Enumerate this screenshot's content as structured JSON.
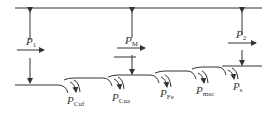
{
  "diagram": {
    "stroke_color": "#333333",
    "labels": {
      "p1": {
        "main": "P",
        "sub": "1"
      },
      "pm": {
        "main": "P",
        "sub": "M"
      },
      "p2": {
        "main": "P",
        "sub": "2"
      },
      "pcuf": {
        "main": "P",
        "sub": "Cuf"
      },
      "pcua": {
        "main": "P",
        "sub": "Cua"
      },
      "pfe": {
        "main": "P",
        "sub": "Fe"
      },
      "pmec": {
        "main": "P",
        "sub": "mec"
      },
      "ps": {
        "main": "P",
        "sub": "s"
      }
    }
  }
}
